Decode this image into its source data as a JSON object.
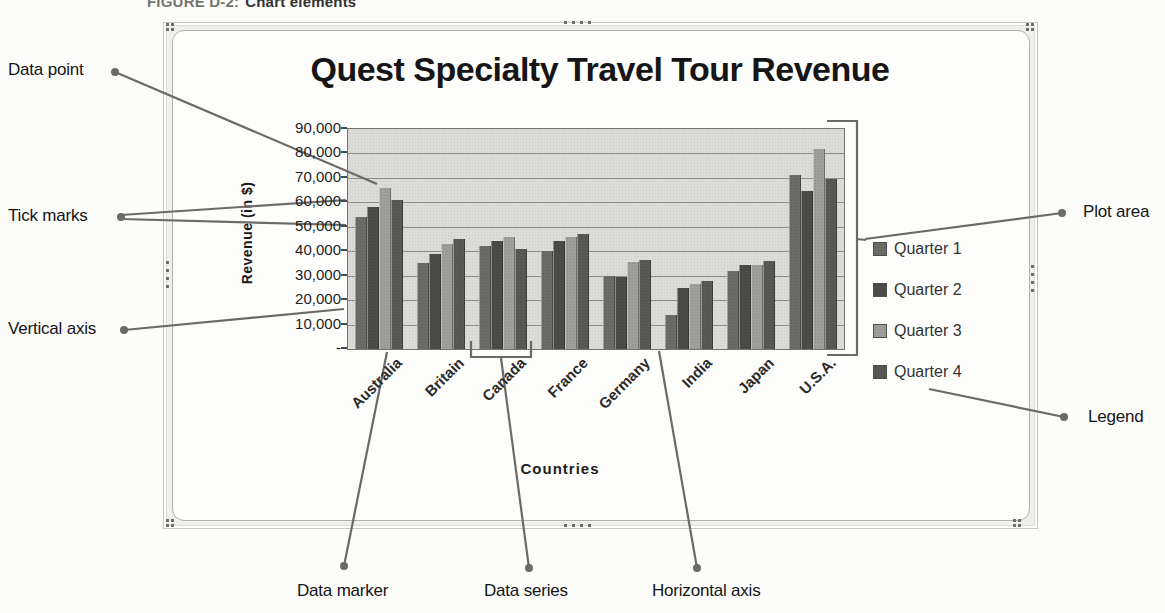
{
  "figure_caption": {
    "label": "FIGURE D-2:",
    "title": "Chart elements"
  },
  "chart_data": {
    "type": "bar",
    "title": "Quest Specialty Travel Tour Revenue",
    "xlabel": "Countries",
    "ylabel": "Revenue (in $)",
    "ylim": [
      0,
      90000
    ],
    "grid": true,
    "legend_position": "right",
    "y_tick_labels": [
      "90,000",
      "80,000",
      "70,000",
      "60,000",
      "50,000",
      "40,000",
      "30,000",
      "20,000",
      "10,000",
      "-"
    ],
    "categories": [
      "Australia",
      "Britain",
      "Canada",
      "France",
      "Germany",
      "India",
      "Japan",
      "U.S.A."
    ],
    "series": [
      {
        "name": "Quarter 1",
        "color": "#6b6b69",
        "values": [
          54000,
          35000,
          42000,
          40000,
          30000,
          14000,
          32000,
          71000
        ]
      },
      {
        "name": "Quarter 2",
        "color": "#4b4b49",
        "values": [
          58000,
          39000,
          44000,
          44000,
          29500,
          25000,
          34500,
          64500
        ]
      },
      {
        "name": "Quarter 3",
        "color": "#9e9e9c",
        "values": [
          66000,
          43000,
          46000,
          46000,
          35500,
          26500,
          34500,
          82000
        ]
      },
      {
        "name": "Quarter 4",
        "color": "#585856",
        "values": [
          61000,
          45000,
          41000,
          47000,
          36500,
          28000,
          36000,
          69500
        ]
      }
    ]
  },
  "callouts": {
    "data_point": "Data point",
    "tick_marks": "Tick marks",
    "vertical_axis": "Vertical axis",
    "plot_area": "Plot area",
    "legend": "Legend",
    "data_marker": "Data marker",
    "data_series": "Data series",
    "horizontal_axis": "Horizontal axis"
  }
}
